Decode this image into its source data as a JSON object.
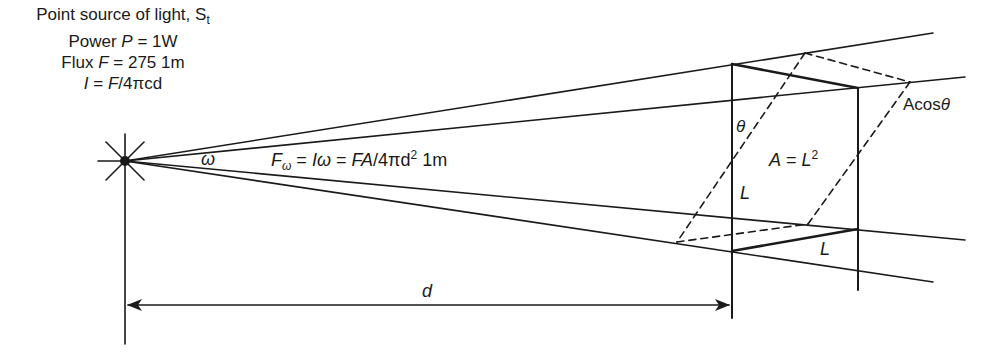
{
  "diagram": {
    "source_block": {
      "line1_prefix": "Point source of light, S",
      "line1_sub": "t",
      "line2_prefix": "Power ",
      "line2_var": "P",
      "line2_rest": " = 1W",
      "line3_prefix": "Flux ",
      "line3_var": "F",
      "line3_rest": " = 275 1m",
      "line4_var1": "I",
      "line4_mid": " = ",
      "line4_var2": "F",
      "line4_rest": "/4πcd"
    },
    "omega_label": "ω",
    "flux_equation": {
      "var": "F",
      "sub": "ω",
      "part2": " = ",
      "i_var": "I",
      "omega": "ω",
      "part3": " = ",
      "fa": "FA",
      "part4": "/4πd",
      "exp": "2",
      "unit": " 1m"
    },
    "theta_label": "θ",
    "area_label": {
      "var": "A",
      "mid": " = ",
      "var2": "L",
      "exp": "2"
    },
    "projected_area_label": {
      "prefix": "Acos",
      "theta": "θ"
    },
    "side_label_vertical": "L",
    "side_label_bottom": "L",
    "distance_label": "d",
    "colors": {
      "line": "#1a1a1a",
      "background": "#ffffff"
    }
  }
}
